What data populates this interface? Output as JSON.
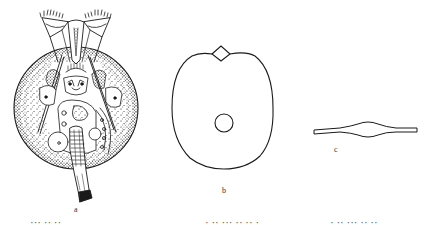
{
  "figure": {
    "panels": [
      {
        "id": "a",
        "label": "a",
        "subject": "rotifer-whole-body"
      },
      {
        "id": "b",
        "label": "b",
        "subject": "lorica-outline"
      },
      {
        "id": "c",
        "label": "c",
        "subject": "lorica-cross-section"
      }
    ],
    "colors": {
      "ink": "#1a1a1a",
      "background": "#ffffff"
    }
  },
  "caption": {
    "parts": [
      "··· ·· ··",
      "· ·· ··· ·· ·· ·",
      "· ·· ··· ·· ··"
    ]
  }
}
